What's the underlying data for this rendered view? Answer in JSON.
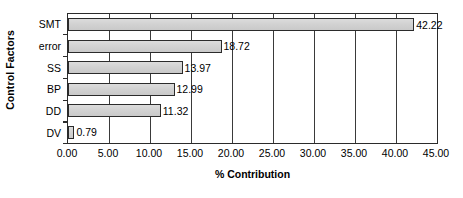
{
  "chart_data": {
    "type": "bar",
    "orientation": "horizontal",
    "title": "",
    "xlabel": "% Contribution",
    "ylabel": "Control Factors",
    "categories": [
      "SMT",
      "error",
      "SS",
      "BP",
      "DD",
      "DV"
    ],
    "values": [
      42.22,
      18.72,
      13.97,
      12.99,
      11.32,
      0.79
    ],
    "value_labels": [
      "42.22",
      "18.72",
      "13.97",
      "12.99",
      "11.32",
      "0.79"
    ],
    "xlim": [
      0,
      45
    ],
    "xticks": [
      0,
      5,
      10,
      15,
      20,
      25,
      30,
      35,
      40,
      45
    ],
    "xtick_labels": [
      "0.00",
      "5.00",
      "10.00",
      "15.00",
      "20.00",
      "25.00",
      "30.00",
      "35.00",
      "40.00",
      "45.00"
    ],
    "grid": "vertical",
    "legend": "none",
    "bar_fill_color": "#d4d4d4",
    "bar_border_color": "#2b2b2b",
    "axis_color": "#2b2b2b",
    "gridline_color": "#3a3a3a",
    "background_color": "#ffffff",
    "text_color": "#000000"
  }
}
